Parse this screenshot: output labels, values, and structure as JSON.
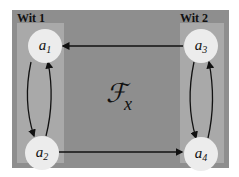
{
  "diagram": {
    "center_label": {
      "symbol": "ℱ",
      "subscript": "x"
    },
    "witnesses": [
      {
        "label": "Wit 1",
        "nodes": [
          "a1",
          "a2"
        ]
      },
      {
        "label": "Wit 2",
        "nodes": [
          "a3",
          "a4"
        ]
      }
    ],
    "nodes": [
      {
        "id": "a1",
        "base": "a",
        "sub": "1"
      },
      {
        "id": "a2",
        "base": "a",
        "sub": "2"
      },
      {
        "id": "a3",
        "base": "a",
        "sub": "3"
      },
      {
        "id": "a4",
        "base": "a",
        "sub": "4"
      }
    ],
    "edges": [
      {
        "from": "a3",
        "to": "a1"
      },
      {
        "from": "a2",
        "to": "a4"
      },
      {
        "from": "a1",
        "to": "a2"
      },
      {
        "from": "a2",
        "to": "a1"
      },
      {
        "from": "a3",
        "to": "a4"
      },
      {
        "from": "a4",
        "to": "a3"
      }
    ],
    "colors": {
      "frame": "#8e8e8e",
      "strip": "#a9a9a9",
      "node": "#ececec",
      "ink": "#111111"
    }
  }
}
